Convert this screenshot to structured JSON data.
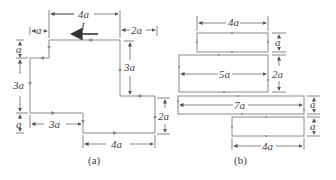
{
  "figure_a": {
    "caption": "(a)",
    "current_label": "I",
    "dims": {
      "top_width": "4a",
      "top_left_offset": "a",
      "top_right_offset": "2a",
      "left_top_height": "a",
      "left_height": "3a",
      "left_bottom_height": "a",
      "right_inner_height": "3a",
      "bottom_left_width": "3a",
      "right_height": "2a",
      "bottom_width": "4a"
    }
  },
  "figure_b": {
    "caption": "(b)",
    "rects": [
      {
        "width_label": "4a",
        "height_label": "a"
      },
      {
        "width_label": "5a",
        "height_label": "2a"
      },
      {
        "width_label": "7a",
        "height_label": "a"
      },
      {
        "width_label": "4a",
        "height_label": "a"
      }
    ]
  },
  "colors": {
    "wire": "#8a8a8a",
    "dimension": "#555555",
    "text": "#444444"
  }
}
